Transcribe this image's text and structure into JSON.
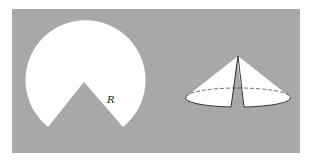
{
  "figure": {
    "background_color": "#ffffff",
    "panel_color": "#a8a8a8",
    "shape_color": "#ffffff",
    "line_color": "#222222",
    "sector": {
      "description": "Circular disk of radius R with a wedge (sector) cut out at the bottom",
      "radius_label": "R"
    },
    "cone": {
      "description": "Remaining disk folded into a cone; slit shows where the edges meet",
      "base_rim_style": "dashed back edge, solid front edge"
    }
  }
}
